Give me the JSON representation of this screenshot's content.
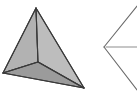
{
  "canvas": {
    "width": 137,
    "height": 94,
    "background_color": "#ffffff"
  },
  "figures": [
    {
      "id": "shaded-tetrahedron",
      "name": "shaded-tetrahedron",
      "kind": "solid-polyhedron",
      "description": "Shaded three-dimensional tetrahedron with three visible triangular faces meeting at an interior vertex",
      "stroke_color": "#3a3a3a",
      "stroke_width": 1.1,
      "vertices": {
        "apex": [
          36,
          8
        ],
        "left": [
          3,
          73
        ],
        "right": [
          84,
          88
        ],
        "interior": [
          38,
          62
        ]
      },
      "faces": [
        {
          "name": "left-face",
          "points": "36,8 3,73 38,62",
          "fill": "#b2b2b2"
        },
        {
          "name": "right-face",
          "points": "36,8 38,62 84,88",
          "fill": "#bdbdbd"
        },
        {
          "name": "bottom-face",
          "points": "3,73 38,62 84,88",
          "fill": "#9b9b9b"
        }
      ],
      "edges": [
        {
          "name": "apex-to-left-edge",
          "from": [
            36,
            8
          ],
          "to": [
            3,
            73
          ]
        },
        {
          "name": "apex-to-right-edge",
          "from": [
            36,
            8
          ],
          "to": [
            84,
            88
          ]
        },
        {
          "name": "apex-to-interior-edge",
          "from": [
            36,
            8
          ],
          "to": [
            38,
            62
          ]
        },
        {
          "name": "left-to-interior-edge",
          "from": [
            3,
            73
          ],
          "to": [
            38,
            62
          ]
        },
        {
          "name": "interior-to-right-edge",
          "from": [
            38,
            62
          ],
          "to": [
            84,
            88
          ]
        },
        {
          "name": "left-to-right-base-edge",
          "from": [
            3,
            73
          ],
          "to": [
            84,
            88
          ]
        }
      ]
    },
    {
      "id": "wireframe-chevron",
      "name": "wireframe-chevron",
      "kind": "outline-partial",
      "description": "Partial wireframe triangle outline forming a left-pointing chevron, clipped by the right image edge, with a horizontal line from its vertex",
      "stroke_color": "#6a6a6a",
      "stroke_width": 1.1,
      "fill": "none",
      "vertices": {
        "left_vertex": [
          104,
          47
        ],
        "upper_arm_end": [
          137,
          6
        ],
        "lower_arm_end": [
          137,
          90
        ]
      },
      "edges": [
        {
          "name": "upper-arm-edge",
          "from": [
            104,
            47
          ],
          "to": [
            137,
            6
          ]
        },
        {
          "name": "lower-arm-edge",
          "from": [
            104,
            47
          ],
          "to": [
            137,
            90
          ]
        },
        {
          "name": "horizontal-line-edge",
          "from": [
            106,
            47
          ],
          "to": [
            137,
            47
          ],
          "stroke_color": "#8e8e8e"
        }
      ]
    }
  ]
}
